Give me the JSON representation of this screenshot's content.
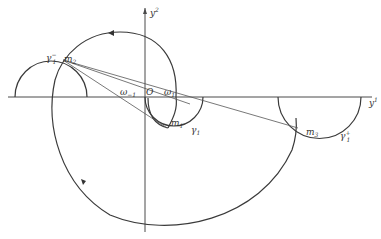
{
  "figure": {
    "axes": {
      "vertical_label": "y",
      "vertical_sup": "2",
      "horizontal_label": "y",
      "horizontal_sup": "1",
      "origin_label": "O"
    },
    "points": [
      {
        "id": "m2",
        "label": "m",
        "sub": "2"
      },
      {
        "id": "m1",
        "label": "m",
        "sub": "1"
      },
      {
        "id": "m3",
        "label": "m",
        "sub": "3"
      }
    ],
    "curves": [
      {
        "id": "gamma1_minus",
        "label": "γ",
        "sub": "1",
        "sup": "−"
      },
      {
        "id": "gamma1",
        "label": "γ",
        "sub": "1"
      },
      {
        "id": "gamma1_plus",
        "label": "γ",
        "sub": "1",
        "sup": "+"
      }
    ],
    "angles": [
      {
        "id": "omega_minus1",
        "label": "ω",
        "sub": "−1"
      },
      {
        "id": "omega1",
        "label": "ω",
        "sub": "1"
      }
    ],
    "colors": {
      "line": "#3a3a3a",
      "background": "#ffffff"
    }
  }
}
